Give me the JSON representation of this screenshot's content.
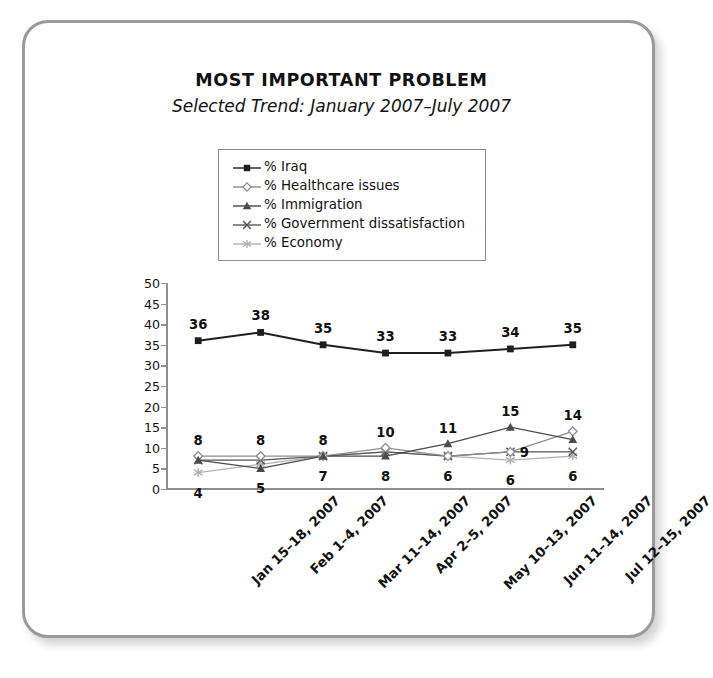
{
  "chart_data": {
    "type": "line",
    "title": "MOST IMPORTANT PROBLEM",
    "subtitle": "Selected Trend: January 2007–July 2007",
    "xlabel": "",
    "ylabel": "",
    "ylim": [
      0,
      50
    ],
    "ytick_step": 5,
    "yticks": [
      "50",
      "45",
      "40",
      "35",
      "30",
      "25",
      "20",
      "15",
      "10",
      "5",
      "0"
    ],
    "grid": false,
    "legend_position": "top-center",
    "categories": [
      "Jan 15–18, 2007",
      "Feb 1–4, 2007",
      "Mar 11–14, 2007",
      "Apr 2–5, 2007",
      "May 10–13, 2007",
      "Jun 11–14, 2007",
      "Jul 12–15, 2007"
    ],
    "series": [
      {
        "name": "% Iraq",
        "marker": "filled-square",
        "color": "#1f1f1f",
        "values": [
          36,
          38,
          35,
          33,
          33,
          34,
          35
        ],
        "labels": [
          "36",
          "38",
          "35",
          "33",
          "33",
          "34",
          "35"
        ],
        "label_position": "above"
      },
      {
        "name": "% Healthcare issues",
        "marker": "open-diamond",
        "color": "#8d8d8d",
        "values": [
          8,
          8,
          8,
          10,
          8,
          9,
          14
        ],
        "labels": [
          "8",
          "8",
          "8",
          "10",
          "",
          "",
          "14"
        ],
        "label_position": "above"
      },
      {
        "name": "% Immigration",
        "marker": "filled-triangle",
        "color": "#4a4a4a",
        "values": [
          7,
          5,
          8,
          8,
          11,
          15,
          12
        ],
        "labels": [
          "",
          "5",
          "7",
          "8",
          "11",
          "15",
          ""
        ],
        "label_position": "mixed"
      },
      {
        "name": "% Government dissatisfaction",
        "marker": "cross-x",
        "color": "#565656",
        "values": [
          7,
          7,
          8,
          9,
          8,
          9,
          9
        ],
        "labels": [
          "",
          "",
          "",
          "",
          "",
          "9",
          ""
        ],
        "label_position": "right"
      },
      {
        "name": "% Economy",
        "marker": "asterisk",
        "color": "#b0b0b0",
        "values": [
          4,
          6,
          8,
          9,
          8,
          7,
          8
        ],
        "labels": [
          "4",
          "",
          "",
          "",
          "6",
          "6",
          "6"
        ],
        "label_position": "below"
      }
    ]
  },
  "legend": {
    "entries": [
      {
        "label": "% Iraq"
      },
      {
        "label": "% Healthcare issues"
      },
      {
        "label": "% Immigration"
      },
      {
        "label": "% Government dissatisfaction"
      },
      {
        "label": "% Economy"
      }
    ]
  },
  "colors": {
    "frame_border": "#9a9a9a",
    "axis": "#8e8e8e",
    "text": "#111111",
    "background": "#ffffff"
  }
}
